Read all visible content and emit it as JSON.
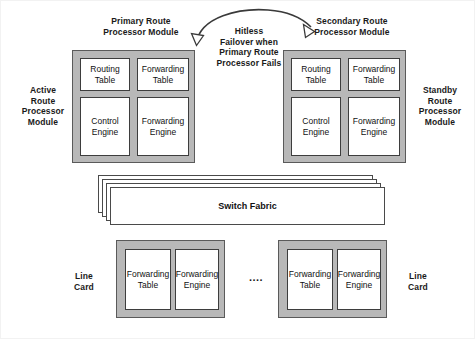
{
  "diagram": {
    "title_primary": "Primary Route\nProcessor Module",
    "title_secondary": "Secondary Route\nProcessor Module",
    "label_active": "Active\nRoute\nProcessor\nModule",
    "label_standby": "Standby\nRoute\nProcessor\nModule",
    "failover_note": "Hitless\nFailover when\nPrimary Route\nProcessor Fails",
    "ellipsis": "....",
    "colors": {
      "chassis_fill": "#b8b8b8",
      "chassis_stroke": "#5a5a5a",
      "box_fill": "#ffffff",
      "box_stroke": "#3d3d3d",
      "text": "#111111",
      "background": "#ffffff"
    }
  },
  "primary_module": {
    "components": [
      {
        "name": "routing-table",
        "label": "Routing\nTable"
      },
      {
        "name": "forwarding-table",
        "label": "Forwarding\nTable"
      },
      {
        "name": "control-engine",
        "label": "Control\nEngine"
      },
      {
        "name": "forwarding-engine",
        "label": "Forwarding\nEngine"
      }
    ]
  },
  "secondary_module": {
    "components": [
      {
        "name": "routing-table",
        "label": "Routing\nTable"
      },
      {
        "name": "forwarding-table",
        "label": "Forwarding\nTable"
      },
      {
        "name": "control-engine",
        "label": "Control\nEngine"
      },
      {
        "name": "forwarding-engine",
        "label": "Forwarding\nEngine"
      }
    ]
  },
  "switch_fabric": {
    "label": "Switch Fabric",
    "sheet_count": 4
  },
  "line_cards": [
    {
      "label": "Line\nCard",
      "label_side": "left",
      "components": [
        {
          "name": "forwarding-table",
          "label": "Forwarding\nTable"
        },
        {
          "name": "forwarding-engine",
          "label": "Forwarding\nEngine"
        }
      ]
    },
    {
      "label": "Line\nCard",
      "label_side": "right",
      "components": [
        {
          "name": "forwarding-table",
          "label": "Forwarding\nTable"
        },
        {
          "name": "forwarding-engine",
          "label": "Forwarding\nEngine"
        }
      ]
    }
  ]
}
